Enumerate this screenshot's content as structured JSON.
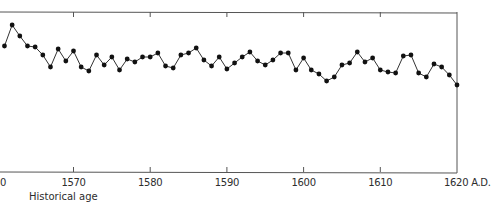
{
  "chart_data": {
    "type": "line",
    "title": "",
    "xlabel": "Historical age",
    "ylabel": "",
    "x_unit_suffix": "A.D.",
    "xlim": [
      1560.5,
      1620
    ],
    "ylim_note": "y axis unlabeled; values are relative heights (higher = up)",
    "grid": false,
    "legend": null,
    "x_ticks": [
      1560,
      1570,
      1580,
      1590,
      1600,
      1610,
      1620
    ],
    "x_tick_labels": [
      "0",
      "1570",
      "1580",
      "1590",
      "1600",
      "1610",
      "1620 A.D."
    ],
    "x": [
      1561,
      1562,
      1563,
      1564,
      1565,
      1566,
      1567,
      1568,
      1569,
      1570,
      1571,
      1572,
      1573,
      1574,
      1575,
      1576,
      1577,
      1578,
      1579,
      1580,
      1581,
      1582,
      1583,
      1584,
      1585,
      1586,
      1587,
      1588,
      1589,
      1590,
      1591,
      1592,
      1593,
      1594,
      1595,
      1596,
      1597,
      1598,
      1599,
      1600,
      1601,
      1602,
      1603,
      1604,
      1605,
      1606,
      1607,
      1608,
      1609,
      1610,
      1611,
      1612,
      1613,
      1614,
      1615,
      1616,
      1617,
      1618,
      1619,
      1620
    ],
    "series": [
      {
        "name": "historical series",
        "values": [
          39,
          60,
          49,
          39,
          38,
          30,
          18,
          36,
          24,
          34,
          18,
          14,
          30,
          20,
          28,
          15,
          26,
          23,
          28,
          28,
          32,
          19,
          17,
          30,
          32,
          37,
          25,
          19,
          28,
          16,
          22,
          28,
          33,
          24,
          20,
          25,
          32,
          32,
          15,
          27,
          15,
          11,
          4,
          8,
          20,
          22,
          33,
          23,
          27,
          15,
          13,
          12,
          29,
          30,
          12,
          8,
          21,
          18,
          10,
          0
        ]
      }
    ]
  },
  "plot": {
    "line_color": "#333333",
    "marker_color": "#111111",
    "axis_color": "#555555"
  }
}
